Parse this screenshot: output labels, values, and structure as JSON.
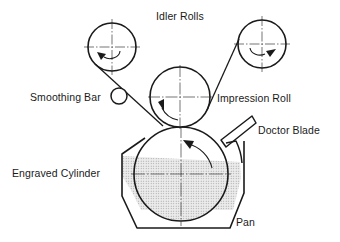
{
  "diagram": {
    "type": "gravure printing schematic",
    "labels": {
      "idler_rolls": "Idler Rolls",
      "smoothing_bar": "Smoothing Bar",
      "impression_roll": "Impression Roll",
      "doctor_blade": "Doctor Blade",
      "engraved_cylinder": "Engraved Cylinder",
      "pan": "Pan"
    },
    "components": [
      {
        "id": "idler-roll-left",
        "shape": "circle",
        "cx": 112,
        "cy": 47,
        "r": 24,
        "rotation": "counterclockwise"
      },
      {
        "id": "idler-roll-right",
        "shape": "circle",
        "cx": 262,
        "cy": 44,
        "r": 24,
        "rotation": "clockwise"
      },
      {
        "id": "smoothing-bar",
        "shape": "circle",
        "cx": 119,
        "cy": 96,
        "r": 8
      },
      {
        "id": "impression-roll",
        "shape": "circle",
        "cx": 180,
        "cy": 97,
        "r": 30,
        "rotation": "clockwise"
      },
      {
        "id": "engraved-cylinder",
        "shape": "circle",
        "cx": 181,
        "cy": 174,
        "r": 47,
        "rotation": "counterclockwise"
      },
      {
        "id": "doctor-blade",
        "shape": "blade"
      },
      {
        "id": "pan",
        "shape": "octagonal trough with ink"
      }
    ],
    "colors": {
      "line": "#1a1a1a",
      "ink_fill": "#d9d9d9",
      "background": "#ffffff"
    }
  }
}
